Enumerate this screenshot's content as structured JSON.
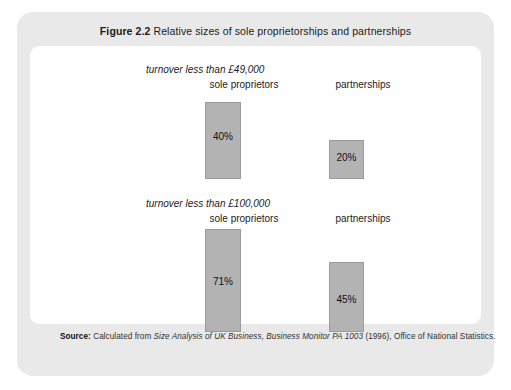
{
  "figure": {
    "number": "Figure 2.2",
    "title": "Relative sizes of sole proprietorships and partnerships",
    "source_word": "Source:",
    "source_prefix": "Calculated from",
    "source_italic": "Size Analysis of UK Business, Business Monitor PA 1003",
    "source_suffix": "(1996), Office of National Statistics."
  },
  "chart_data": {
    "type": "bar",
    "title": "Relative sizes of sole proprietorships and partnerships",
    "xlabel": "",
    "ylabel": "",
    "ylim": [
      0,
      100
    ],
    "grid": false,
    "legend": "none",
    "groups": [
      {
        "group_label": "turnover less than £49,000",
        "categories": [
          "sole proprietors",
          "partnerships"
        ],
        "values": [
          40,
          20
        ],
        "value_labels": [
          "40%",
          "20%"
        ]
      },
      {
        "group_label": "turnover less than £100,000",
        "categories": [
          "sole proprietors",
          "partnerships"
        ],
        "values": [
          71,
          45
        ],
        "value_labels": [
          "71%",
          "45%"
        ]
      }
    ],
    "bar_color": "#b3b3b3",
    "bar_border_color": "#9b9b9b"
  },
  "colors": {
    "card_frame": "#e9e9e9",
    "plot_background": "#ffffff",
    "bar_fill": "#b3b3b3",
    "text": "#1b1b1b"
  }
}
